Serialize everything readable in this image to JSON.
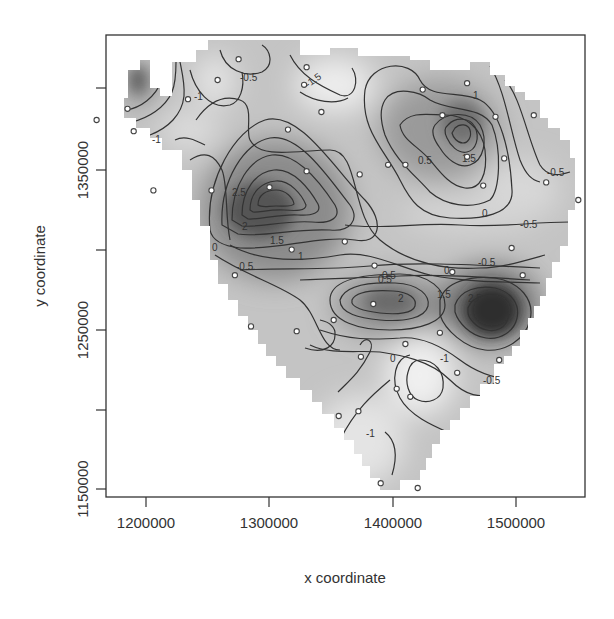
{
  "chart_data": {
    "type": "contour",
    "title": "",
    "xlabel": "x coordinate",
    "ylabel": "y coordinate",
    "xlim": [
      1167600,
      1556000
    ],
    "ylim": [
      1145000,
      1433000
    ],
    "x_ticks": [
      1200000,
      1300000,
      1400000,
      1500000
    ],
    "x_tick_labels": [
      "1200000",
      "1300000",
      "1400000",
      "1500000"
    ],
    "y_ticks": [
      1150000,
      1200000,
      1250000,
      1300000,
      1350000,
      1400000
    ],
    "y_tick_labels": [
      "1150000",
      "1250000",
      "1350000"
    ],
    "grid": false,
    "legend": null,
    "contour_levels": [
      -1.5,
      -1,
      -0.5,
      0,
      0.5,
      1,
      1.5,
      2,
      2.5
    ],
    "contour_labels": [
      "-0.5",
      "-1.5",
      "-1",
      "-1",
      "2.5",
      "2",
      "1.5",
      "1",
      "0",
      "-0.5",
      "0.5",
      "1",
      "1.5",
      "0.5",
      "-0.5",
      "0",
      "-0.5",
      "-0.5",
      "0",
      "0.5",
      "2",
      "1.5",
      "2.5",
      "-1",
      "-0.5",
      "-1",
      "0"
    ],
    "peaks": [
      {
        "x": 1290000,
        "y": 1325000,
        "value": 2.5,
        "label": "high west-central"
      },
      {
        "x": 1460000,
        "y": 1385000,
        "value": 1.5,
        "label": "high north-east"
      },
      {
        "x": 1405000,
        "y": 1255000,
        "value": 2.0,
        "label": "high south-central"
      },
      {
        "x": 1480000,
        "y": 1250000,
        "value": 2.5,
        "label": "high south-east"
      }
    ],
    "troughs": [
      {
        "x": 1340000,
        "y": 1395000,
        "value": -1.5
      },
      {
        "x": 1420000,
        "y": 1225000,
        "value": -1.0
      },
      {
        "x": 1225000,
        "y": 1395000,
        "value": -1.0
      }
    ],
    "sample_points": [
      [
        1160000,
        1380000
      ],
      [
        1185000,
        1387000
      ],
      [
        1190000,
        1373000
      ],
      [
        1234000,
        1393000
      ],
      [
        1206000,
        1336000
      ],
      [
        1258000,
        1405000
      ],
      [
        1275000,
        1418000
      ],
      [
        1330000,
        1413000
      ],
      [
        1328000,
        1402000
      ],
      [
        1342000,
        1385000
      ],
      [
        1315000,
        1374000
      ],
      [
        1396000,
        1352000
      ],
      [
        1373000,
        1346000
      ],
      [
        1361000,
        1304000
      ],
      [
        1330000,
        1348000
      ],
      [
        1318000,
        1299000
      ],
      [
        1253000,
        1336000
      ],
      [
        1300000,
        1338000
      ],
      [
        1272000,
        1283000
      ],
      [
        1285000,
        1251000
      ],
      [
        1410000,
        1352000
      ],
      [
        1424000,
        1399000
      ],
      [
        1460000,
        1403000
      ],
      [
        1483000,
        1382000
      ],
      [
        1440000,
        1383000
      ],
      [
        1460000,
        1357000
      ],
      [
        1490000,
        1356000
      ],
      [
        1514000,
        1383000
      ],
      [
        1524000,
        1341000
      ],
      [
        1550000,
        1330000
      ],
      [
        1473000,
        1339000
      ],
      [
        1496000,
        1300000
      ],
      [
        1505000,
        1283000
      ],
      [
        1448000,
        1285000
      ],
      [
        1385000,
        1289000
      ],
      [
        1384000,
        1265000
      ],
      [
        1352000,
        1255000
      ],
      [
        1322000,
        1248000
      ],
      [
        1374000,
        1232000
      ],
      [
        1410000,
        1240000
      ],
      [
        1438000,
        1247000
      ],
      [
        1452000,
        1222000
      ],
      [
        1486000,
        1230000
      ],
      [
        1403000,
        1212000
      ],
      [
        1372000,
        1198000
      ],
      [
        1356000,
        1195000
      ],
      [
        1414000,
        1207000
      ],
      [
        1390000,
        1153000
      ],
      [
        1420000,
        1150000
      ]
    ]
  },
  "axes": {
    "x_title": "x coordinate",
    "y_title": "y coordinate",
    "x_labels": [
      "1200000",
      "1300000",
      "1400000",
      "1500000"
    ],
    "y_labels": [
      "1150000",
      "1250000",
      "1350000"
    ]
  }
}
